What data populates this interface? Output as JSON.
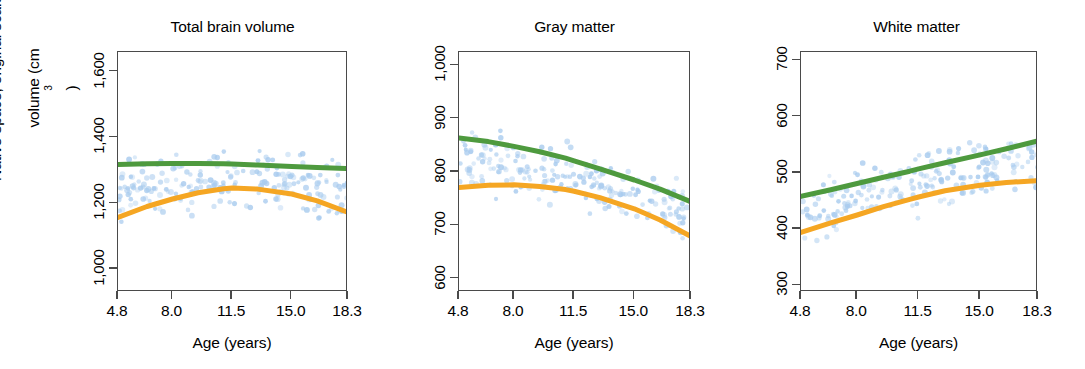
{
  "figure": {
    "ylabel_line1": "Native space, original scale",
    "ylabel_line2": "volume (cm",
    "ylabel_sup": "3",
    "ylabel_line2_end": ")",
    "xlabel": "Age (years)",
    "accent_green": "#4E9A3E",
    "accent_orange": "#F5A623",
    "point_color": "#A8CBEE",
    "frame_color": "#4A4A4A"
  },
  "chart_data": [
    {
      "type": "scatter",
      "title": "Total brain volume",
      "xlabel": "Age (years)",
      "ylabel": "Native space, original scale volume (cm3)",
      "xlim": [
        4.8,
        18.3
      ],
      "ylim": [
        930,
        1660
      ],
      "xticks": [
        4.8,
        8.0,
        11.5,
        15.0,
        18.3
      ],
      "xtick_labels": [
        "4.8",
        "8.0",
        "11.5",
        "15.0",
        "18.3"
      ],
      "yticks": [
        1000,
        1200,
        1400,
        1600
      ],
      "ytick_labels": [
        "1,000",
        "1,200",
        "1,400",
        "1,600"
      ],
      "grid": false,
      "legend": "none",
      "series": [
        {
          "name": "green-fit",
          "type": "line",
          "color": "#4E9A3E",
          "x": [
            4.8,
            6.5,
            8.0,
            9.5,
            11.0,
            11.5,
            13.0,
            15.0,
            16.5,
            18.3
          ],
          "y": [
            1318,
            1320,
            1321,
            1321,
            1320,
            1319,
            1316,
            1312,
            1309,
            1305
          ]
        },
        {
          "name": "orange-fit",
          "type": "line",
          "color": "#F5A623",
          "x": [
            4.8,
            6.5,
            8.0,
            9.5,
            11.0,
            11.5,
            13.0,
            15.0,
            16.5,
            18.3
          ],
          "y": [
            1157,
            1190,
            1213,
            1232,
            1244,
            1246,
            1243,
            1228,
            1207,
            1172
          ]
        },
        {
          "name": "observations",
          "type": "scatter",
          "color": "#A8CBEE",
          "n_points": 210,
          "x_range": [
            4.8,
            18.3
          ],
          "y_range": [
            950,
            1650
          ]
        }
      ]
    },
    {
      "type": "scatter",
      "title": "Gray matter",
      "xlabel": "Age (years)",
      "xlim": [
        4.8,
        18.3
      ],
      "ylim": [
        575,
        1025
      ],
      "xticks": [
        4.8,
        8.0,
        11.5,
        15.0,
        18.3
      ],
      "xtick_labels": [
        "4.8",
        "8.0",
        "11.5",
        "15.0",
        "18.3"
      ],
      "yticks": [
        600,
        700,
        800,
        900,
        1000
      ],
      "ytick_labels": [
        "600",
        "700",
        "800",
        "900",
        "1,000"
      ],
      "grid": false,
      "legend": "none",
      "series": [
        {
          "name": "green-fit",
          "type": "line",
          "color": "#4E9A3E",
          "x": [
            4.8,
            6.5,
            8.0,
            9.5,
            11.0,
            11.5,
            13.0,
            15.0,
            16.5,
            18.3
          ],
          "y": [
            864,
            857,
            848,
            838,
            826,
            821,
            806,
            785,
            768,
            744
          ]
        },
        {
          "name": "orange-fit",
          "type": "line",
          "color": "#F5A623",
          "x": [
            4.8,
            6.5,
            8.0,
            9.5,
            11.0,
            11.5,
            13.0,
            15.0,
            16.5,
            18.3
          ],
          "y": [
            771,
            775,
            776,
            773,
            767,
            764,
            752,
            731,
            710,
            679
          ]
        },
        {
          "name": "observations",
          "type": "scatter",
          "color": "#A8CBEE",
          "n_points": 210,
          "x_range": [
            4.8,
            18.3
          ],
          "y_range": [
            600,
            1010
          ]
        }
      ]
    },
    {
      "type": "scatter",
      "title": "White matter",
      "xlabel": "Age (years)",
      "xlim": [
        4.8,
        18.3
      ],
      "ylim": [
        288,
        715
      ],
      "xticks": [
        4.8,
        8.0,
        11.5,
        15.0,
        18.3
      ],
      "xtick_labels": [
        "4.8",
        "8.0",
        "11.5",
        "15.0",
        "18.3"
      ],
      "yticks": [
        300,
        400,
        500,
        600,
        700
      ],
      "ytick_labels": [
        "300",
        "400",
        "500",
        "600",
        "700"
      ],
      "grid": false,
      "legend": "none",
      "series": [
        {
          "name": "green-fit",
          "type": "line",
          "color": "#4E9A3E",
          "x": [
            4.8,
            6.5,
            8.0,
            9.5,
            11.0,
            11.5,
            13.0,
            15.0,
            16.5,
            18.3
          ],
          "y": [
            458,
            470,
            481,
            492,
            503,
            507,
            518,
            532,
            543,
            557
          ]
        },
        {
          "name": "orange-fit",
          "type": "line",
          "color": "#F5A623",
          "x": [
            4.8,
            6.5,
            8.0,
            9.5,
            11.0,
            11.5,
            13.0,
            15.0,
            16.5,
            18.3
          ],
          "y": [
            394,
            411,
            425,
            440,
            453,
            457,
            468,
            478,
            483,
            486
          ]
        },
        {
          "name": "observations",
          "type": "scatter",
          "color": "#A8CBEE",
          "n_points": 210,
          "x_range": [
            4.8,
            18.3
          ],
          "y_range": [
            350,
            710
          ]
        }
      ]
    }
  ]
}
